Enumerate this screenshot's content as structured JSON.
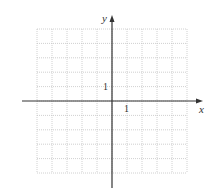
{
  "figure": {
    "type": "coordinate-grid",
    "x_axis_label": "x",
    "y_axis_label": "y",
    "x_tick_label": "1",
    "y_tick_label": "1",
    "grid": {
      "columns": 10,
      "rows": 10,
      "x_range": [
        -5,
        5
      ],
      "y_range": [
        -5,
        5
      ]
    },
    "colors": {
      "axis": "#333333",
      "grid": "#bdbdbd",
      "background": "#ffffff"
    }
  }
}
